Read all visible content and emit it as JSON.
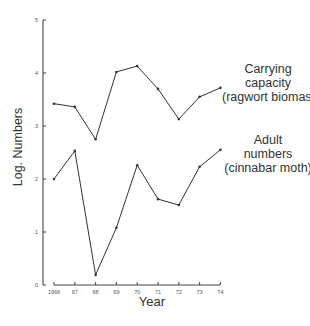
{
  "chart_data": {
    "type": "line",
    "title": "",
    "xlabel": "Year",
    "ylabel": "Log. Numbers",
    "ylim": [
      0,
      5
    ],
    "yticks": [
      "0",
      "1",
      "2",
      "3",
      "4",
      "5"
    ],
    "categories": [
      "1966",
      "67",
      "68",
      "69",
      "70",
      "71",
      "72",
      "73",
      "74"
    ],
    "grid": false,
    "legend": "inline labels at right end of each line",
    "series": [
      {
        "name": "Carrying capacity (ragwort biomas)",
        "label_lines": [
          "Carrying",
          "capacity",
          "(ragwort biomas)"
        ],
        "values": [
          3.42,
          3.36,
          2.75,
          4.02,
          4.13,
          3.7,
          3.13,
          3.55,
          3.72
        ]
      },
      {
        "name": "Adult numbers (cinnabar moth)",
        "label_lines": [
          "Adult",
          "numbers",
          "(cinnabar moth)"
        ],
        "values": [
          2.0,
          2.53,
          0.19,
          1.08,
          2.26,
          1.62,
          1.51,
          2.23,
          2.55
        ]
      }
    ]
  },
  "colors": {
    "line": "#333333",
    "axis": "#444444",
    "text": "#333333"
  }
}
